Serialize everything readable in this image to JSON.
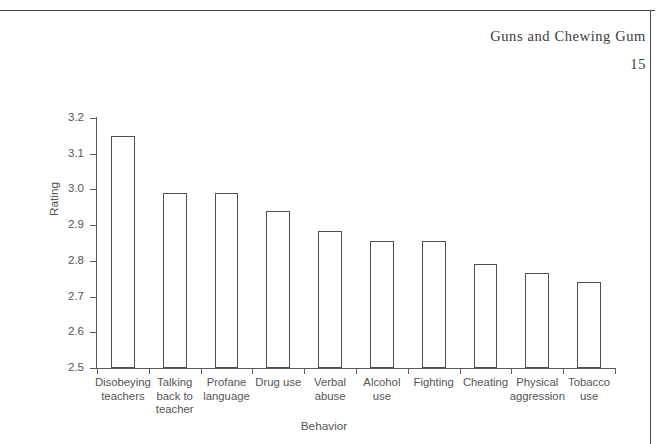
{
  "page": {
    "running_head": "Guns and Chewing Gum",
    "page_number": "15"
  },
  "axis": {
    "y_title": "Rating",
    "x_title": "Behavior",
    "y_ticks": [
      "3.2",
      "3.1",
      "3.0",
      "2.9",
      "2.8",
      "2.7",
      "2.6",
      "2.5"
    ]
  },
  "chart_data": {
    "type": "bar",
    "title": "",
    "xlabel": "Behavior",
    "ylabel": "Rating",
    "ylim": [
      2.5,
      3.2
    ],
    "ytick_values": [
      3.2,
      3.1,
      3.0,
      2.9,
      2.8,
      2.7,
      2.6,
      2.5
    ],
    "grid": false,
    "legend": "none",
    "categories": [
      "Disobeying teachers",
      "Talking back to teacher",
      "Profane language",
      "Drug use",
      "Verbal abuse",
      "Alcohol use",
      "Fighting",
      "Cheating",
      "Physical aggression",
      "Tobacco use"
    ],
    "category_label_lines": [
      [
        "Disobeying",
        "teachers"
      ],
      [
        "Talking",
        "back to",
        "teacher"
      ],
      [
        "Profane",
        "language"
      ],
      [
        "Drug use"
      ],
      [
        "Verbal",
        "abuse"
      ],
      [
        "Alcohol",
        "use"
      ],
      [
        "Fighting"
      ],
      [
        "Cheating"
      ],
      [
        "Physical",
        "aggression"
      ],
      [
        "Tobacco",
        "use"
      ]
    ],
    "values": [
      3.15,
      2.99,
      2.99,
      2.94,
      2.885,
      2.855,
      2.855,
      2.79,
      2.765,
      2.74
    ],
    "bar_fill": "#ffffff",
    "bar_edge": "#4f4f4f"
  },
  "colors": {
    "ink": "#555555",
    "frame": "#4a4a4a"
  }
}
